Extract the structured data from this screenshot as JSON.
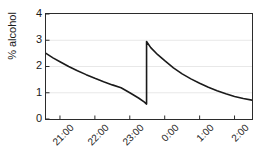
{
  "chart_data": {
    "type": "line",
    "title": "",
    "xlabel": "",
    "ylabel": "% alcohol",
    "ylim": [
      0,
      4
    ],
    "yticks": [
      0,
      1,
      2,
      3,
      4
    ],
    "ytick_labels": [
      "0",
      "1",
      "2",
      "3",
      "4"
    ],
    "xtick_labels": [
      "21:00",
      "22:00",
      "23:00",
      "0:00",
      "1:00",
      "2:00"
    ],
    "xtick_hours": [
      21.0,
      22.0,
      23.0,
      24.0,
      25.0,
      26.0
    ],
    "xlim_hours": [
      20.6,
      26.5
    ],
    "grid": "horizontal",
    "grid_color": "#e8e8e8",
    "line_color": "#1a1a1a",
    "legend": "none",
    "series": [
      {
        "name": "% alcohol",
        "x": [
          20.6,
          20.8,
          21.0,
          21.25,
          21.5,
          21.75,
          22.0,
          22.25,
          22.5,
          22.75,
          23.0,
          23.25,
          23.42,
          23.48,
          23.48,
          23.6,
          23.8,
          24.0,
          24.25,
          24.5,
          24.75,
          25.0,
          25.25,
          25.5,
          25.75,
          26.0,
          26.25,
          26.5
        ],
        "y": [
          2.5,
          2.33,
          2.18,
          2.0,
          1.84,
          1.69,
          1.55,
          1.42,
          1.3,
          1.19,
          1.0,
          0.8,
          0.64,
          0.57,
          2.95,
          2.72,
          2.45,
          2.22,
          1.95,
          1.72,
          1.53,
          1.36,
          1.21,
          1.08,
          0.96,
          0.86,
          0.78,
          0.72
        ]
      }
    ],
    "annotations": [
      {
        "name": "dose-spike",
        "at_hour": 23.48,
        "from": 0.57,
        "to": 2.95
      }
    ]
  }
}
